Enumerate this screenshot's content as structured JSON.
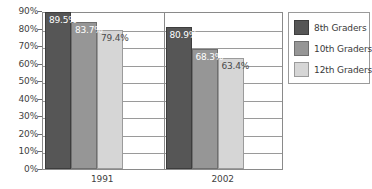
{
  "chart_data": {
    "type": "bar",
    "title": "",
    "subtitle": "",
    "xlabel": "",
    "ylabel": "",
    "categories": [
      "1991",
      "2002"
    ],
    "series": [
      {
        "name": "8th Graders",
        "color": "#565656",
        "values": [
          89.5,
          83.7
        ],
        "labels": [
          "89.5%",
          "80.9%"
        ]
      },
      {
        "name": "10th Graders",
        "color": "#969696",
        "values": [
          83.7,
          68.3
        ],
        "labels": [
          "83.7%",
          "68.3%"
        ]
      },
      {
        "name": "12th Graders",
        "color": "#d6d6d6",
        "values": [
          79.4,
          63.4
        ],
        "labels": [
          "79.4%",
          "63.4%"
        ]
      }
    ],
    "group_values": {
      "1991": {
        "8th Graders": 89.5,
        "10th Graders": 83.7,
        "12th Graders": 79.4
      },
      "2002": {
        "8th Graders": 80.9,
        "10th Graders": 68.3,
        "12th Graders": 63.4
      }
    },
    "ylim": [
      0,
      90
    ],
    "ytick_labels": [
      "90%",
      "80%",
      "70%",
      "60%",
      "50%",
      "40%",
      "30%",
      "20%",
      "10%",
      "0%"
    ],
    "ytick_values": [
      90,
      80,
      70,
      60,
      50,
      40,
      30,
      20,
      10,
      0
    ],
    "grid": true,
    "legend_position": "right"
  },
  "bars": [
    {
      "label": "89.5%",
      "value": 89.5,
      "series": "8th Graders",
      "group": "1991",
      "tone": "dark"
    },
    {
      "label": "83.7%",
      "value": 83.7,
      "series": "10th Graders",
      "group": "1991",
      "tone": "mid"
    },
    {
      "label": "79.4%",
      "value": 79.4,
      "series": "12th Graders",
      "group": "1991",
      "tone": "light"
    },
    {
      "label": "80.9%",
      "value": 80.9,
      "series": "8th Graders",
      "group": "2002",
      "tone": "dark"
    },
    {
      "label": "68.3%",
      "value": 68.3,
      "series": "10th Graders",
      "group": "2002",
      "tone": "mid"
    },
    {
      "label": "63.4%",
      "value": 63.4,
      "series": "12th Graders",
      "group": "2002",
      "tone": "light"
    }
  ],
  "legend": {
    "items": [
      {
        "label": "8th Graders",
        "tone": "dark"
      },
      {
        "label": "10th Graders",
        "tone": "mid"
      },
      {
        "label": "12th Graders",
        "tone": "light"
      }
    ]
  },
  "colors": {
    "series_8th": "#565656",
    "series_10th": "#969696",
    "series_12th": "#d6d6d6",
    "axis": "#8a8a8a",
    "grid": "#9a9a9a",
    "text": "#3a3a3a",
    "background": "#ffffff"
  }
}
